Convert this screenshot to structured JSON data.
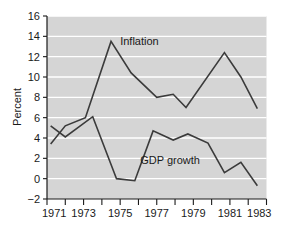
{
  "chart_data": {
    "type": "line",
    "title": "",
    "xlabel": "",
    "ylabel": "Percent",
    "xlim": [
      1971,
      1983
    ],
    "ylim": [
      -2,
      16
    ],
    "grid": true,
    "grid_axis": "y",
    "legend_position": "inline-annotation",
    "y_ticks": [
      16,
      14,
      12,
      10,
      8,
      6,
      4,
      2,
      0,
      -2
    ],
    "y_tick_labels": [
      "16",
      "14",
      "12",
      "10",
      "8",
      "6",
      "4",
      "2",
      "0",
      "−2"
    ],
    "x_ticks": [
      1971,
      1972,
      1973,
      1974,
      1975,
      1976,
      1977,
      1978,
      1979,
      1980,
      1981,
      1982,
      1983
    ],
    "x_tick_labels_shown": [
      "1971",
      "1973",
      "1975",
      "1977",
      "1979",
      "1981",
      "1983"
    ],
    "x_tick_labels_shown_values": [
      1971,
      1973,
      1975,
      1977,
      1979,
      1981,
      1983
    ],
    "series": [
      {
        "name": "Inflation",
        "color": "#3b3b3b",
        "label_x": 1975.0,
        "label_y": 13.1,
        "x": [
          1971.2,
          1972.0,
          1973.1,
          1974.5,
          1975.6,
          1977.0,
          1977.9,
          1978.6,
          1980.7,
          1981.6,
          1982.5
        ],
        "values": [
          3.4,
          5.2,
          6.0,
          13.5,
          10.4,
          8.0,
          8.3,
          7.0,
          12.4,
          10.0,
          6.9
        ]
      },
      {
        "name": "GDP growth",
        "color": "#3b3b3b",
        "label_x": 1976.1,
        "label_y": 1.4,
        "x": [
          1971.2,
          1972.0,
          1973.5,
          1974.8,
          1975.8,
          1976.8,
          1977.9,
          1978.7,
          1979.8,
          1980.7,
          1981.6,
          1982.5
        ],
        "values": [
          5.2,
          4.1,
          6.1,
          0.0,
          -0.2,
          4.7,
          3.8,
          4.4,
          3.5,
          0.6,
          1.6,
          -0.7
        ]
      }
    ],
    "colors": {
      "plot_background": "#d5d5d5",
      "gridline": "#ffffff",
      "axis": "#1a1a1a",
      "line": "#3b3b3b",
      "page_background": "#ffffff",
      "text": "#1a1a1a"
    }
  }
}
